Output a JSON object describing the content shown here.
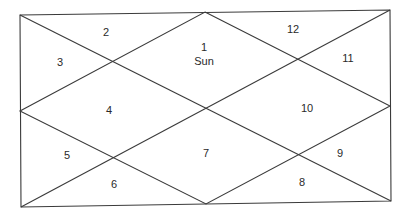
{
  "diagram": {
    "type": "north-indian-horoscope-chart",
    "frame": {
      "top_left": [
        20,
        15
      ],
      "top_right": [
        390,
        10
      ],
      "bottom_right": [
        391,
        201
      ],
      "bottom_left": [
        21,
        207
      ],
      "top_mid": [
        205,
        12
      ],
      "right_mid": [
        390,
        106
      ],
      "bottom_mid": [
        206,
        204
      ],
      "left_mid": [
        20,
        111
      ],
      "line_color": "#3a3a3a"
    },
    "houses": [
      {
        "number": "1",
        "label_pos": [
          204,
          47
        ],
        "planets": [
          "Sun"
        ],
        "planet_pos": [
          204,
          61
        ]
      },
      {
        "number": "2",
        "label_pos": [
          106,
          32
        ],
        "planets": []
      },
      {
        "number": "3",
        "label_pos": [
          60,
          62
        ],
        "planets": []
      },
      {
        "number": "4",
        "label_pos": [
          109,
          110
        ],
        "planets": []
      },
      {
        "number": "5",
        "label_pos": [
          67,
          155
        ],
        "planets": []
      },
      {
        "number": "6",
        "label_pos": [
          114,
          184
        ],
        "planets": []
      },
      {
        "number": "7",
        "label_pos": [
          206,
          153
        ],
        "planets": []
      },
      {
        "number": "8",
        "label_pos": [
          302,
          182
        ],
        "planets": []
      },
      {
        "number": "9",
        "label_pos": [
          340,
          153
        ],
        "planets": []
      },
      {
        "number": "10",
        "label_pos": [
          307,
          108
        ],
        "planets": []
      },
      {
        "number": "11",
        "label_pos": [
          348,
          58
        ],
        "planets": []
      },
      {
        "number": "12",
        "label_pos": [
          293,
          29
        ],
        "planets": []
      }
    ]
  }
}
